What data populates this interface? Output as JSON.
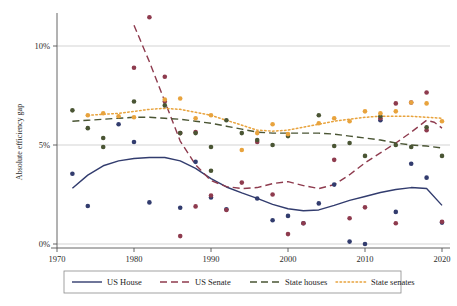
{
  "chart_data": {
    "type": "scatter",
    "title": "",
    "xlabel": "",
    "ylabel": "Absolute efficiency gap",
    "xlim": [
      1970,
      2020
    ],
    "ylim": [
      0,
      12.2
    ],
    "xticks": [
      1970,
      1980,
      1990,
      2000,
      2010,
      2020
    ],
    "xtick_labels": [
      "1970",
      "1980",
      "1990",
      "2000",
      "2010",
      "2020"
    ],
    "yticks": [
      0,
      5,
      10
    ],
    "ytick_labels": [
      "0%",
      "5%",
      "10%"
    ],
    "grid": "horizontal",
    "legend_position": "bottom",
    "series": [
      {
        "name": "US House",
        "color": "#323c6e",
        "linestyle": "solid",
        "points": [
          {
            "x": 1972,
            "y": 3.55
          },
          {
            "x": 1974,
            "y": 1.92
          },
          {
            "x": 1978,
            "y": 6.05
          },
          {
            "x": 1980,
            "y": 5.15
          },
          {
            "x": 1982,
            "y": 2.1
          },
          {
            "x": 1986,
            "y": 1.83
          },
          {
            "x": 1988,
            "y": 4.15
          },
          {
            "x": 1990,
            "y": 2.35
          },
          {
            "x": 1992,
            "y": 1.75
          },
          {
            "x": 1996,
            "y": 2.3
          },
          {
            "x": 1998,
            "y": 1.2
          },
          {
            "x": 2000,
            "y": 1.42
          },
          {
            "x": 2002,
            "y": 1.05
          },
          {
            "x": 2004,
            "y": 2.05
          },
          {
            "x": 2006,
            "y": 3.0
          },
          {
            "x": 2008,
            "y": 0.12
          },
          {
            "x": 2010,
            "y": 0.0
          },
          {
            "x": 2012,
            "y": 6.25
          },
          {
            "x": 2014,
            "y": 1.62
          },
          {
            "x": 2016,
            "y": 4.05
          },
          {
            "x": 2018,
            "y": 3.35
          },
          {
            "x": 2020,
            "y": 1.08
          }
        ],
        "trend": [
          {
            "x": 1972,
            "y": 2.82
          },
          {
            "x": 1974,
            "y": 3.48
          },
          {
            "x": 1976,
            "y": 3.95
          },
          {
            "x": 1978,
            "y": 4.2
          },
          {
            "x": 1980,
            "y": 4.32
          },
          {
            "x": 1982,
            "y": 4.37
          },
          {
            "x": 1984,
            "y": 4.37
          },
          {
            "x": 1986,
            "y": 4.2
          },
          {
            "x": 1988,
            "y": 3.82
          },
          {
            "x": 1990,
            "y": 3.3
          },
          {
            "x": 1992,
            "y": 2.88
          },
          {
            "x": 1994,
            "y": 2.58
          },
          {
            "x": 1996,
            "y": 2.3
          },
          {
            "x": 1998,
            "y": 2.0
          },
          {
            "x": 2000,
            "y": 1.78
          },
          {
            "x": 2002,
            "y": 1.68
          },
          {
            "x": 2004,
            "y": 1.72
          },
          {
            "x": 2006,
            "y": 1.95
          },
          {
            "x": 2008,
            "y": 2.2
          },
          {
            "x": 2010,
            "y": 2.4
          },
          {
            "x": 2012,
            "y": 2.6
          },
          {
            "x": 2014,
            "y": 2.75
          },
          {
            "x": 2016,
            "y": 2.85
          },
          {
            "x": 2018,
            "y": 2.8
          },
          {
            "x": 2020,
            "y": 1.95
          }
        ]
      },
      {
        "name": "US Senate",
        "color": "#8e3b4e",
        "linestyle": "dashed",
        "points": [
          {
            "x": 1982,
            "y": 11.45
          },
          {
            "x": 1980,
            "y": 8.9
          },
          {
            "x": 1984,
            "y": 8.45
          },
          {
            "x": 1984,
            "y": 7.2
          },
          {
            "x": 1986,
            "y": 5.6
          },
          {
            "x": 1988,
            "y": 5.65
          },
          {
            "x": 1986,
            "y": 0.4
          },
          {
            "x": 1988,
            "y": 1.9
          },
          {
            "x": 1990,
            "y": 2.45
          },
          {
            "x": 1992,
            "y": 1.72
          },
          {
            "x": 1994,
            "y": 3.1
          },
          {
            "x": 1996,
            "y": 5.15
          },
          {
            "x": 1998,
            "y": 2.5
          },
          {
            "x": 2000,
            "y": 0.5
          },
          {
            "x": 2002,
            "y": 1.05
          },
          {
            "x": 2006,
            "y": 4.25
          },
          {
            "x": 2008,
            "y": 1.3
          },
          {
            "x": 2010,
            "y": 1.85
          },
          {
            "x": 2012,
            "y": 6.35
          },
          {
            "x": 2014,
            "y": 1.05
          },
          {
            "x": 2014,
            "y": 7.1
          },
          {
            "x": 2016,
            "y": 7.15
          },
          {
            "x": 2018,
            "y": 7.65
          },
          {
            "x": 2018,
            "y": 5.75
          },
          {
            "x": 2020,
            "y": 1.12
          }
        ],
        "trend": [
          {
            "x": 1980,
            "y": 11.05
          },
          {
            "x": 1982,
            "y": 9.2
          },
          {
            "x": 1984,
            "y": 7.2
          },
          {
            "x": 1986,
            "y": 5.2
          },
          {
            "x": 1988,
            "y": 4.0
          },
          {
            "x": 1990,
            "y": 3.2
          },
          {
            "x": 1992,
            "y": 2.9
          },
          {
            "x": 1994,
            "y": 2.8
          },
          {
            "x": 1996,
            "y": 2.85
          },
          {
            "x": 1998,
            "y": 3.05
          },
          {
            "x": 2000,
            "y": 3.15
          },
          {
            "x": 2002,
            "y": 2.95
          },
          {
            "x": 2004,
            "y": 2.8
          },
          {
            "x": 2006,
            "y": 3.0
          },
          {
            "x": 2008,
            "y": 3.5
          },
          {
            "x": 2010,
            "y": 4.1
          },
          {
            "x": 2012,
            "y": 4.6
          },
          {
            "x": 2014,
            "y": 5.1
          },
          {
            "x": 2016,
            "y": 5.65
          },
          {
            "x": 2018,
            "y": 6.25
          },
          {
            "x": 2019,
            "y": 6.15
          },
          {
            "x": 2020,
            "y": 5.85
          }
        ]
      },
      {
        "name": "State houses",
        "color": "#4a5534",
        "linestyle": "dashed",
        "points": [
          {
            "x": 1972,
            "y": 6.75
          },
          {
            "x": 1974,
            "y": 5.85
          },
          {
            "x": 1976,
            "y": 5.35
          },
          {
            "x": 1976,
            "y": 4.9
          },
          {
            "x": 1980,
            "y": 7.2
          },
          {
            "x": 1984,
            "y": 7.0
          },
          {
            "x": 1986,
            "y": 5.6
          },
          {
            "x": 1988,
            "y": 5.6
          },
          {
            "x": 1990,
            "y": 4.9
          },
          {
            "x": 1990,
            "y": 3.7
          },
          {
            "x": 1992,
            "y": 6.25
          },
          {
            "x": 1994,
            "y": 5.6
          },
          {
            "x": 1996,
            "y": 5.25
          },
          {
            "x": 1998,
            "y": 5.0
          },
          {
            "x": 2000,
            "y": 5.45
          },
          {
            "x": 2004,
            "y": 6.5
          },
          {
            "x": 2006,
            "y": 4.95
          },
          {
            "x": 2008,
            "y": 5.1
          },
          {
            "x": 2010,
            "y": 4.45
          },
          {
            "x": 2012,
            "y": 6.45
          },
          {
            "x": 2014,
            "y": 5.0
          },
          {
            "x": 2016,
            "y": 4.9
          },
          {
            "x": 2018,
            "y": 5.9
          },
          {
            "x": 2020,
            "y": 4.45
          }
        ],
        "trend": [
          {
            "x": 1972,
            "y": 6.2
          },
          {
            "x": 1974,
            "y": 6.25
          },
          {
            "x": 1976,
            "y": 6.3
          },
          {
            "x": 1978,
            "y": 6.35
          },
          {
            "x": 1980,
            "y": 6.4
          },
          {
            "x": 1982,
            "y": 6.4
          },
          {
            "x": 1984,
            "y": 6.35
          },
          {
            "x": 1986,
            "y": 6.3
          },
          {
            "x": 1988,
            "y": 6.2
          },
          {
            "x": 1990,
            "y": 6.1
          },
          {
            "x": 1992,
            "y": 5.95
          },
          {
            "x": 1994,
            "y": 5.8
          },
          {
            "x": 1996,
            "y": 5.65
          },
          {
            "x": 1998,
            "y": 5.6
          },
          {
            "x": 2000,
            "y": 5.6
          },
          {
            "x": 2002,
            "y": 5.6
          },
          {
            "x": 2004,
            "y": 5.6
          },
          {
            "x": 2006,
            "y": 5.55
          },
          {
            "x": 2008,
            "y": 5.45
          },
          {
            "x": 2010,
            "y": 5.35
          },
          {
            "x": 2012,
            "y": 5.25
          },
          {
            "x": 2014,
            "y": 5.1
          },
          {
            "x": 2016,
            "y": 5.0
          },
          {
            "x": 2018,
            "y": 4.95
          },
          {
            "x": 2020,
            "y": 4.85
          }
        ]
      },
      {
        "name": "State senates",
        "color": "#e8a33d",
        "linestyle": "dotted",
        "points": [
          {
            "x": 1974,
            "y": 6.5
          },
          {
            "x": 1976,
            "y": 6.6
          },
          {
            "x": 1978,
            "y": 6.45
          },
          {
            "x": 1980,
            "y": 6.4
          },
          {
            "x": 1984,
            "y": 7.3
          },
          {
            "x": 1986,
            "y": 7.35
          },
          {
            "x": 1988,
            "y": 6.35
          },
          {
            "x": 1990,
            "y": 6.5
          },
          {
            "x": 1994,
            "y": 4.75
          },
          {
            "x": 1996,
            "y": 5.6
          },
          {
            "x": 1998,
            "y": 6.05
          },
          {
            "x": 2000,
            "y": 5.55
          },
          {
            "x": 2004,
            "y": 6.1
          },
          {
            "x": 2006,
            "y": 6.35
          },
          {
            "x": 2008,
            "y": 6.2
          },
          {
            "x": 2010,
            "y": 6.7
          },
          {
            "x": 2012,
            "y": 6.6
          },
          {
            "x": 2014,
            "y": 6.7
          },
          {
            "x": 2016,
            "y": 7.15
          },
          {
            "x": 2018,
            "y": 7.1
          },
          {
            "x": 2020,
            "y": 6.2
          }
        ],
        "trend": [
          {
            "x": 1974,
            "y": 6.5
          },
          {
            "x": 1976,
            "y": 6.55
          },
          {
            "x": 1978,
            "y": 6.6
          },
          {
            "x": 1980,
            "y": 6.7
          },
          {
            "x": 1982,
            "y": 6.8
          },
          {
            "x": 1984,
            "y": 6.85
          },
          {
            "x": 1986,
            "y": 6.8
          },
          {
            "x": 1988,
            "y": 6.65
          },
          {
            "x": 1990,
            "y": 6.5
          },
          {
            "x": 1992,
            "y": 6.25
          },
          {
            "x": 1994,
            "y": 6.0
          },
          {
            "x": 1996,
            "y": 5.75
          },
          {
            "x": 1998,
            "y": 5.7
          },
          {
            "x": 2000,
            "y": 5.75
          },
          {
            "x": 2002,
            "y": 5.9
          },
          {
            "x": 2004,
            "y": 6.05
          },
          {
            "x": 2006,
            "y": 6.2
          },
          {
            "x": 2008,
            "y": 6.3
          },
          {
            "x": 2010,
            "y": 6.4
          },
          {
            "x": 2012,
            "y": 6.45
          },
          {
            "x": 2014,
            "y": 6.45
          },
          {
            "x": 2016,
            "y": 6.45
          },
          {
            "x": 2018,
            "y": 6.4
          },
          {
            "x": 2020,
            "y": 6.35
          }
        ]
      }
    ]
  },
  "legend": {
    "items": [
      {
        "label": "US House",
        "color": "#323c6e",
        "style": "solid"
      },
      {
        "label": "US Senate",
        "color": "#8e3b4e",
        "style": "dashed"
      },
      {
        "label": "State houses",
        "color": "#4a5534",
        "style": "dashed"
      },
      {
        "label": "State senates",
        "color": "#e8a33d",
        "style": "dotted"
      }
    ]
  },
  "colors": {
    "background": "#ffffff",
    "axis": "#555555",
    "grid": "#c8c8c8",
    "text": "#2b2b2b",
    "us_house": "#323c6e",
    "us_senate": "#8e3b4e",
    "state_houses": "#4a5534",
    "state_senates": "#e8a33d"
  }
}
